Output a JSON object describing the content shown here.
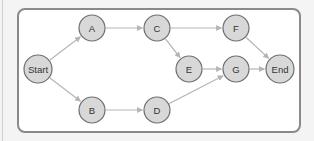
{
  "diagram": {
    "type": "directed-graph",
    "nodes": [
      {
        "id": "start",
        "label": "Start",
        "x": 38,
        "y": 69,
        "r": 14
      },
      {
        "id": "a",
        "label": "A",
        "x": 92,
        "y": 28,
        "r": 13
      },
      {
        "id": "b",
        "label": "B",
        "x": 92,
        "y": 110,
        "r": 13
      },
      {
        "id": "c",
        "label": "C",
        "x": 157,
        "y": 28,
        "r": 13
      },
      {
        "id": "d",
        "label": "D",
        "x": 157,
        "y": 110,
        "r": 13
      },
      {
        "id": "e",
        "label": "E",
        "x": 189,
        "y": 69,
        "r": 13
      },
      {
        "id": "f",
        "label": "F",
        "x": 236,
        "y": 28,
        "r": 13
      },
      {
        "id": "g",
        "label": "G",
        "x": 236,
        "y": 69,
        "r": 13
      },
      {
        "id": "end",
        "label": "End",
        "x": 280,
        "y": 69,
        "r": 14
      }
    ],
    "edges": [
      {
        "from": "start",
        "to": "a"
      },
      {
        "from": "start",
        "to": "b"
      },
      {
        "from": "a",
        "to": "c"
      },
      {
        "from": "b",
        "to": "d"
      },
      {
        "from": "c",
        "to": "f"
      },
      {
        "from": "c",
        "to": "e"
      },
      {
        "from": "e",
        "to": "g"
      },
      {
        "from": "d",
        "to": "g"
      },
      {
        "from": "f",
        "to": "end"
      },
      {
        "from": "g",
        "to": "end"
      }
    ],
    "colors": {
      "node_fill": "#d8d8d8",
      "node_stroke": "#6e6e6e",
      "edge": "#b4b4b4",
      "frame_border": "#8a8a8a",
      "background": "#ffffff"
    }
  }
}
